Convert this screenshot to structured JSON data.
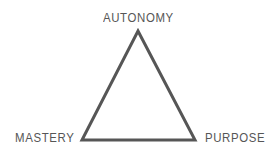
{
  "diagram": {
    "type": "triangle-diagram",
    "background_color": "#ffffff",
    "stroke_color": "#565656",
    "stroke_width": 3,
    "text_color": "#565656",
    "vertices": [
      {
        "id": "autonomy",
        "label": "AUTONOMY",
        "position": "top",
        "point": {
          "x": 138,
          "y": 31
        }
      },
      {
        "id": "mastery",
        "label": "MASTERY",
        "position": "bottom-left",
        "point": {
          "x": 82,
          "y": 140
        }
      },
      {
        "id": "purpose",
        "label": "PURPOSE",
        "position": "bottom-right",
        "point": {
          "x": 195,
          "y": 140
        }
      }
    ],
    "edges": [
      {
        "id": "edge-autonomy-mastery",
        "from": "autonomy",
        "to": "mastery"
      },
      {
        "id": "edge-autonomy-purpose",
        "from": "autonomy",
        "to": "purpose"
      },
      {
        "id": "edge-mastery-purpose",
        "from": "mastery",
        "to": "purpose"
      }
    ]
  }
}
